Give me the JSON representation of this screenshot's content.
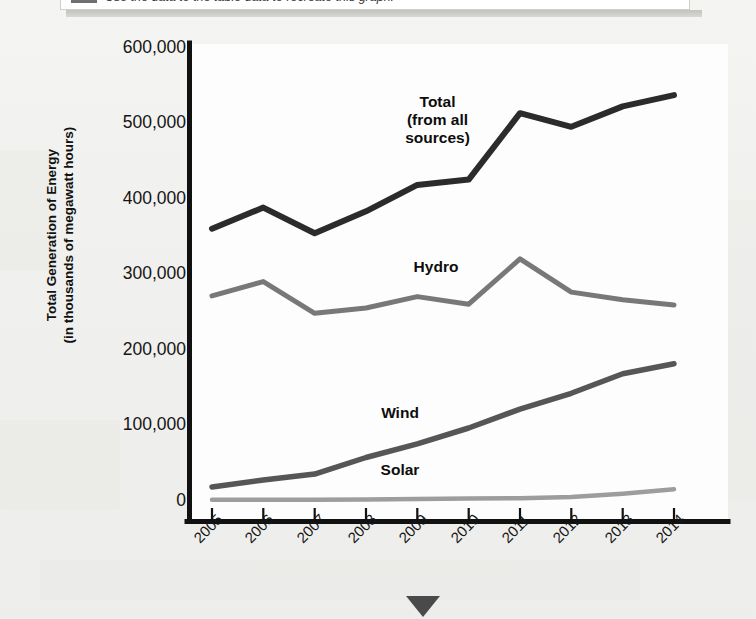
{
  "banner": {
    "text": "Use the data to the table data to recreate this graph.",
    "swatch_color": "#6f6f6f"
  },
  "chart_data": {
    "type": "line",
    "title": "",
    "xlabel": "",
    "ylabel": "Total Generation of Energy (in thousands of megawatt hours)",
    "ylabel_line1": "Total Generation of Energy",
    "ylabel_line2": "(in thousands of megawatt hours)",
    "categories": [
      "2005",
      "2006",
      "2007",
      "2008",
      "2009",
      "2010",
      "2011",
      "2012",
      "2013",
      "2014"
    ],
    "ylim": [
      0,
      600000
    ],
    "ytick_labels": [
      "600,000",
      "500,000",
      "400,000",
      "300,000",
      "200,000",
      "100,000",
      "0"
    ],
    "ytick_values": [
      600000,
      500000,
      400000,
      300000,
      200000,
      100000,
      0
    ],
    "grid": false,
    "legend_position": "inline-annotations",
    "series": [
      {
        "name": "Total (from all sources)",
        "label_lines": [
          "Total",
          "(from all",
          "sources)"
        ],
        "color": "#2b2b2b",
        "width": 6,
        "values": [
          360000,
          388000,
          354000,
          383000,
          418000,
          425000,
          513000,
          495000,
          522000,
          537000
        ]
      },
      {
        "name": "Hydro",
        "label_lines": [
          "Hydro"
        ],
        "color": "#787878",
        "width": 5,
        "values": [
          271000,
          290000,
          248000,
          255000,
          270000,
          260000,
          320000,
          276000,
          266000,
          259000
        ]
      },
      {
        "name": "Wind",
        "label_lines": [
          "Wind"
        ],
        "color": "#565656",
        "width": 5.5,
        "values": [
          18000,
          27000,
          35000,
          57000,
          75000,
          96000,
          121000,
          142000,
          168000,
          181000
        ]
      },
      {
        "name": "Solar",
        "label_lines": [
          "Solar"
        ],
        "color": "#9d9d9d",
        "width": 4.5,
        "values": [
          1000,
          1000,
          1000,
          1500,
          2000,
          2500,
          3000,
          4500,
          9000,
          15000
        ]
      }
    ],
    "annotations": [
      {
        "text": "Total (from all sources)",
        "x_px": 437,
        "y_px": 103
      },
      {
        "text": "Hydro",
        "x_px": 437,
        "y_px": 266
      },
      {
        "text": "Wind",
        "x_px": 398,
        "y_px": 413
      },
      {
        "text": "Solar",
        "x_px": 398,
        "y_px": 470
      }
    ]
  }
}
